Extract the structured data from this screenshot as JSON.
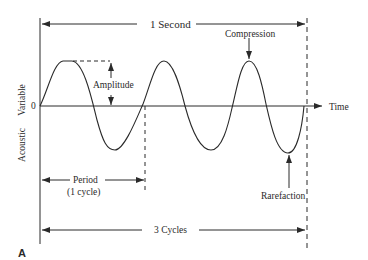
{
  "figure": {
    "panel_label": "A",
    "colors": {
      "line": "#2a2a2a",
      "background": "#ffffff"
    }
  },
  "axes": {
    "y_label_part1": "Acoustic",
    "y_label_part2": "Variable",
    "origin_label": "0",
    "x_label": "Time"
  },
  "annotations": {
    "one_second": "1 Second",
    "compression": "Compression",
    "amplitude": "Amplitude",
    "rarefaction": "Rarefaction",
    "period_line1": "Period",
    "period_line2": "(1 cycle)",
    "three_cycles": "3 Cycles"
  },
  "waveform": {
    "type": "sine",
    "cycles": 3,
    "duration_label": "1 Second",
    "features": [
      "Compression (peak)",
      "Rarefaction (trough)",
      "Amplitude",
      "Period (1 cycle)"
    ]
  }
}
